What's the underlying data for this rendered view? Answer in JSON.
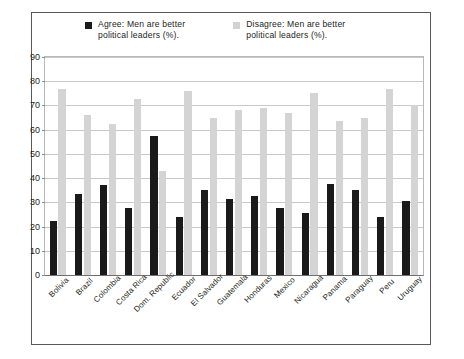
{
  "chart_data": {
    "type": "bar",
    "title": "",
    "subtitle": "",
    "xlabel": "",
    "ylabel": "",
    "ylim": [
      0,
      90
    ],
    "ytick_step": 10,
    "yticks": [
      0,
      10,
      20,
      30,
      40,
      50,
      60,
      70,
      80,
      90
    ],
    "grid": true,
    "legend_position": "top",
    "categories": [
      "Bolivia",
      "Brazil",
      "Colombia",
      "Costa Rica",
      "Dom. Republic",
      "Ecuador",
      "El Salvador",
      "Guatemala",
      "Honduras",
      "Mexico",
      "Nicaragua",
      "Panama",
      "Paraguay",
      "Peru",
      "Uruguay"
    ],
    "series": [
      {
        "name": "Agree: Men are better political leaders (%).",
        "color": "#1a1a1a",
        "values": [
          22.5,
          33.5,
          37,
          27.5,
          57.5,
          24,
          35,
          31.5,
          32.5,
          27.5,
          25.5,
          37.5,
          35,
          24,
          30.5
        ]
      },
      {
        "name": "Disagree: Men are better political leaders (%).",
        "color": "#d4d4d4",
        "values": [
          77,
          66,
          62.5,
          72.5,
          43,
          76,
          65,
          68,
          69,
          67,
          75,
          63.5,
          65,
          77,
          70
        ]
      }
    ]
  },
  "legend": {
    "entries": [
      {
        "label": "Agree: Men are better\npolitical leaders (%).",
        "swatch": "agree"
      },
      {
        "label": "Disagree: Men are better\npolitical leaders (%).",
        "swatch": "disagree"
      }
    ]
  }
}
